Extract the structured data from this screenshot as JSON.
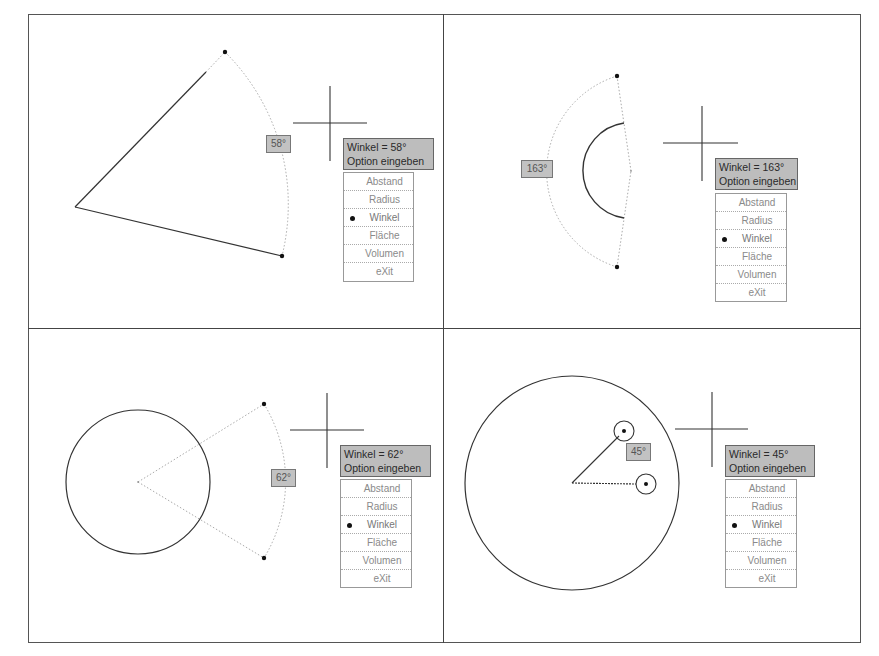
{
  "menu_options": [
    "Abstand",
    "Radius",
    "Winkel",
    "Fläche",
    "Volumen",
    "eXit"
  ],
  "selected_option": "Winkel",
  "colors": {
    "tooltip_bg": "#bdbdbd",
    "angle_box_bg": "#c2c2c2",
    "menu_text": "#8a8a8a",
    "line": "#333333"
  },
  "panels": [
    {
      "id": "top-left",
      "angle_label": "58°",
      "tooltip": {
        "line1": "Winkel = 58°",
        "line2": "Option eingeben"
      },
      "menu": {
        "items": [
          {
            "label": "Abstand",
            "selected": false
          },
          {
            "label": "Radius",
            "selected": false
          },
          {
            "label": "Winkel",
            "selected": true
          },
          {
            "label": "Fläche",
            "selected": false
          },
          {
            "label": "Volumen",
            "selected": false
          },
          {
            "label": "eXit",
            "selected": false
          }
        ]
      }
    },
    {
      "id": "top-right",
      "angle_label": "163°",
      "tooltip": {
        "line1": "Winkel = 163°",
        "line2": "Option eingeben"
      },
      "menu": {
        "items": [
          {
            "label": "Abstand",
            "selected": false
          },
          {
            "label": "Radius",
            "selected": false
          },
          {
            "label": "Winkel",
            "selected": true
          },
          {
            "label": "Fläche",
            "selected": false
          },
          {
            "label": "Volumen",
            "selected": false
          },
          {
            "label": "eXit",
            "selected": false
          }
        ]
      }
    },
    {
      "id": "bottom-left",
      "angle_label": "62°",
      "tooltip": {
        "line1": "Winkel = 62°",
        "line2": "Option eingeben"
      },
      "menu": {
        "items": [
          {
            "label": "Abstand",
            "selected": false
          },
          {
            "label": "Radius",
            "selected": false
          },
          {
            "label": "Winkel",
            "selected": true
          },
          {
            "label": "Fläche",
            "selected": false
          },
          {
            "label": "Volumen",
            "selected": false
          },
          {
            "label": "eXit",
            "selected": false
          }
        ]
      }
    },
    {
      "id": "bottom-right",
      "angle_label": "45°",
      "tooltip": {
        "line1": "Winkel = 45°",
        "line2": "Option eingeben"
      },
      "menu": {
        "items": [
          {
            "label": "Abstand",
            "selected": false
          },
          {
            "label": "Radius",
            "selected": false
          },
          {
            "label": "Winkel",
            "selected": true
          },
          {
            "label": "Fläche",
            "selected": false
          },
          {
            "label": "Volumen",
            "selected": false
          },
          {
            "label": "eXit",
            "selected": false
          }
        ]
      }
    }
  ]
}
